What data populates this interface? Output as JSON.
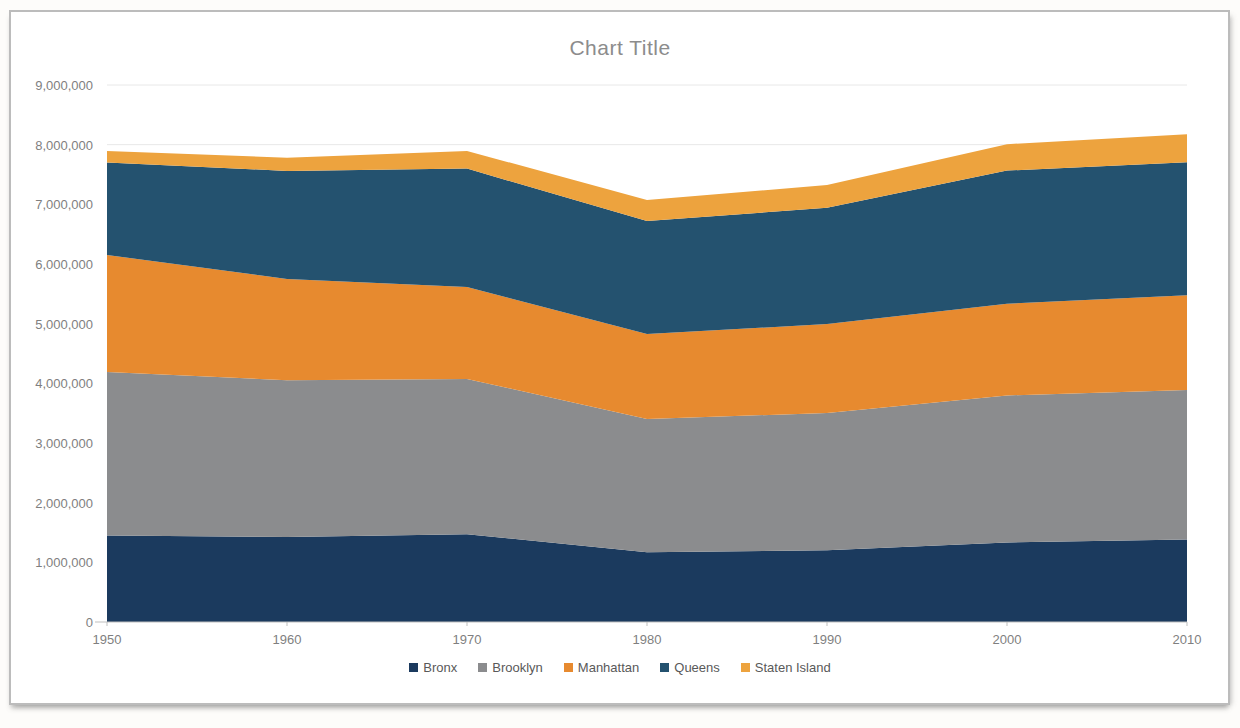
{
  "window": {
    "title": "Chart Title",
    "panel_background": "#ffffff",
    "panel_border_color": "#bcbcbc"
  },
  "chart_data": {
    "type": "area",
    "stacked": true,
    "title": "Chart Title",
    "categories": [
      "1950",
      "1960",
      "1970",
      "1980",
      "1990",
      "2000",
      "2010"
    ],
    "series": [
      {
        "name": "Bronx",
        "color": "#1b3a5e",
        "values": [
          1451277,
          1424815,
          1471701,
          1168972,
          1203789,
          1332650,
          1385108
        ]
      },
      {
        "name": "Brooklyn",
        "color": "#8b8c8e",
        "values": [
          2738175,
          2627319,
          2602012,
          2230936,
          2300664,
          2465326,
          2504700
        ]
      },
      {
        "name": "Manhattan",
        "color": "#e78a2f",
        "values": [
          1960101,
          1698281,
          1539233,
          1428285,
          1487536,
          1537195,
          1585873
        ]
      },
      {
        "name": "Queens",
        "color": "#24526f",
        "values": [
          1550849,
          1809578,
          1986473,
          1891325,
          1951598,
          2229379,
          2230722
        ]
      },
      {
        "name": "Staten Island",
        "color": "#eda33e",
        "values": [
          191555,
          221991,
          295443,
          352029,
          378977,
          443728,
          468730
        ]
      }
    ],
    "xlabel": "",
    "ylabel": "",
    "ylim": [
      0,
      9000000
    ],
    "ytick_step": 1000000,
    "ytick_labels": [
      "0",
      "1,000,000",
      "2,000,000",
      "3,000,000",
      "4,000,000",
      "5,000,000",
      "6,000,000",
      "7,000,000",
      "8,000,000",
      "9,000,000"
    ],
    "grid": true,
    "legend_position": "bottom",
    "axis_text_color": "#7f7f7f",
    "legend_text_color": "#595959",
    "gridline_color": "#e8e8e8",
    "axis_line_color": "#bfbfbf"
  }
}
